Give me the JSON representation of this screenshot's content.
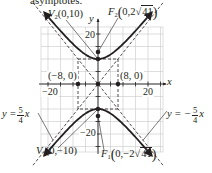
{
  "top_fragment": "asymptotes.",
  "axes": {
    "x_label": "x",
    "y_label": "y",
    "x_ticks": [
      {
        "value": -20,
        "label": "−20"
      },
      {
        "value": 20,
        "label": "20"
      }
    ],
    "y_ticks": [
      {
        "value": 20,
        "label": "20"
      },
      {
        "value": -20,
        "label": "−20"
      }
    ],
    "grid_step": 5,
    "range": {
      "xmin": -23,
      "xmax": 26,
      "ymin": -27,
      "ymax": 23
    }
  },
  "labels": {
    "v2": {
      "name": "V",
      "sub": "2",
      "coords": "(0,10)"
    },
    "f2": {
      "name": "F",
      "sub": "2",
      "open": "(",
      "coords_pre": "0,2",
      "radical": "41",
      "close": ")"
    },
    "v1": {
      "name": "V",
      "sub": "1",
      "coords": "(0,−10)"
    },
    "f1": {
      "name": "F",
      "sub": "1",
      "open": "(",
      "coords_pre": "0,−2",
      "radical": "41",
      "close": ")"
    },
    "left_point": "(−8, 0)",
    "right_point": "(8, 0)",
    "asym_pos": {
      "lhs": "y =",
      "num": "5",
      "den": "4",
      "var": "x"
    },
    "asym_neg": {
      "lhs": "y = −",
      "num": "5",
      "den": "4",
      "var": "x"
    }
  },
  "curve": {
    "equation": "y^2/100 - x^2/64 = 1",
    "a": 10,
    "b": 8,
    "color": "#231f20"
  },
  "colors": {
    "grid": "#c8c8c8",
    "axis": "#231f20",
    "curve": "#231f20",
    "asymptote": "#231f20",
    "text": "#231f20"
  }
}
